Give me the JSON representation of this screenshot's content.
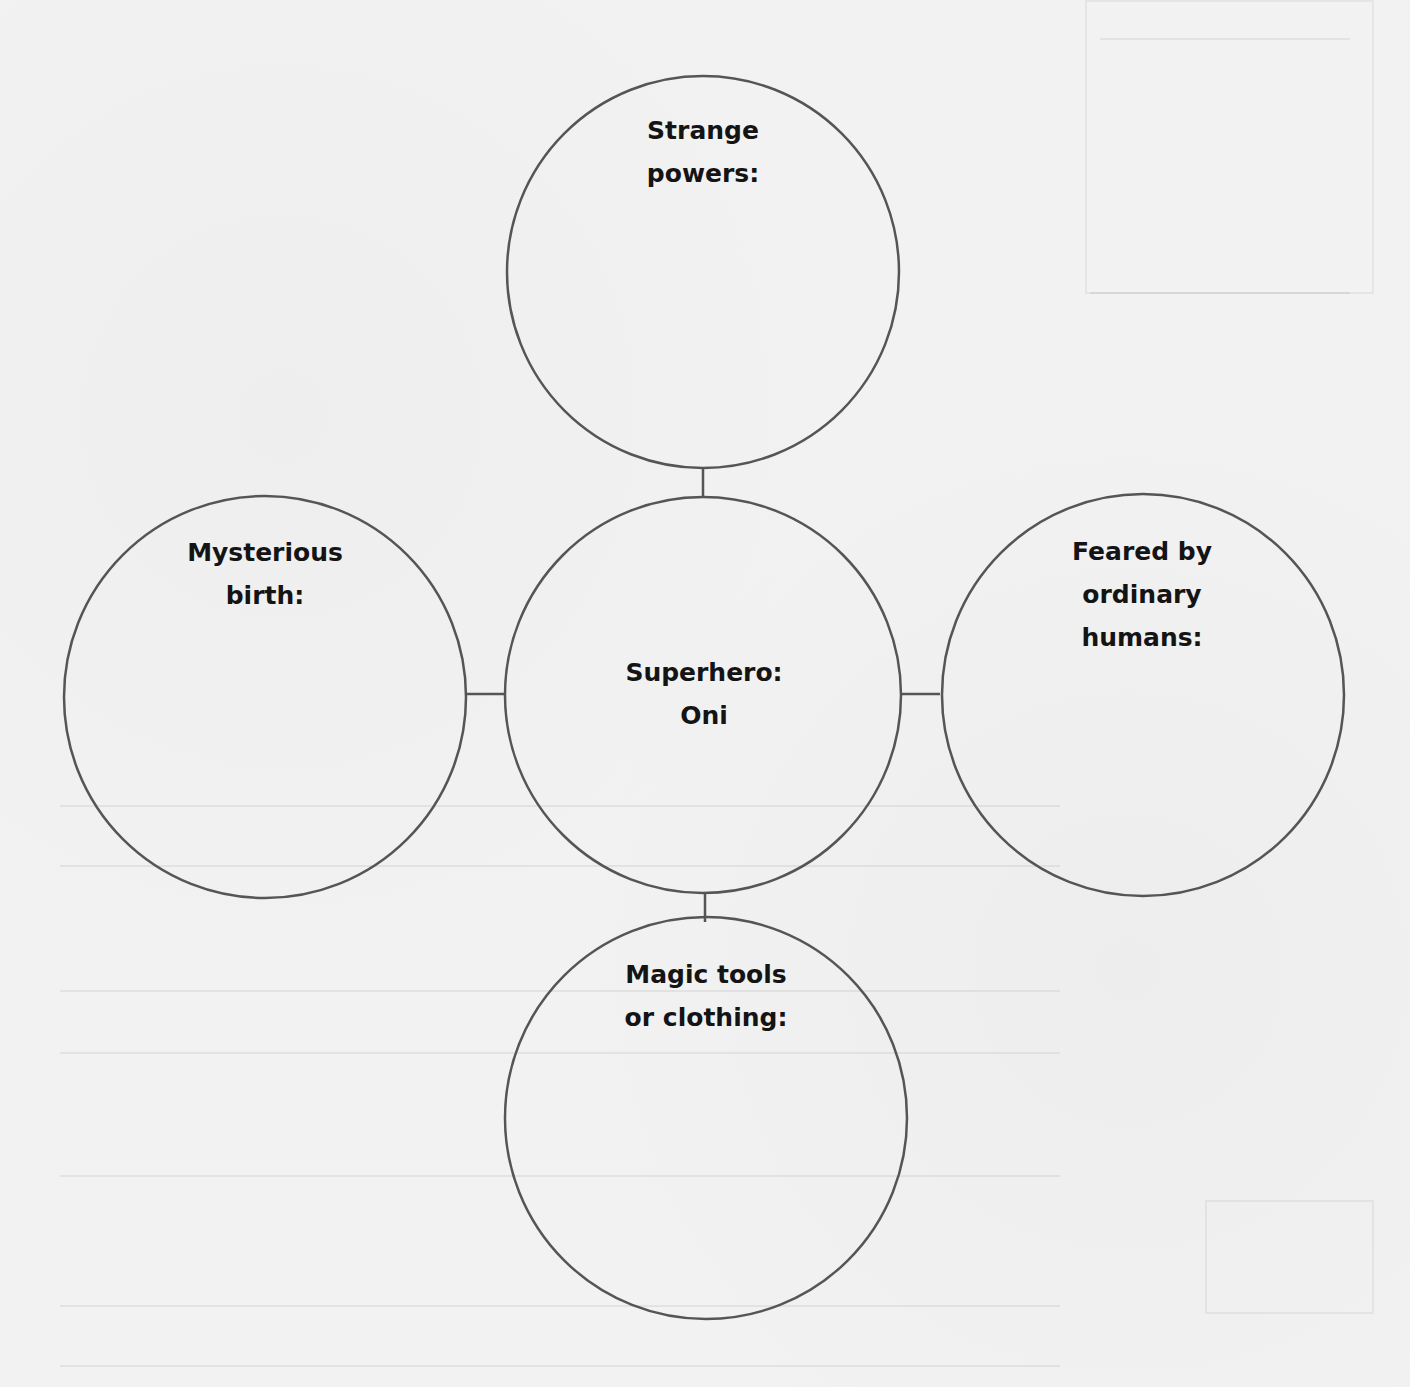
{
  "diagram": {
    "type": "web-organizer",
    "stroke_color": "#555555",
    "text_color": "#141414",
    "background_color": "#f2f2f2",
    "center": {
      "id": "superhero",
      "lines": [
        "Superhero:",
        "Oni"
      ]
    },
    "nodes": [
      {
        "id": "strange-powers",
        "position": "top",
        "lines": [
          "Strange",
          "powers:"
        ]
      },
      {
        "id": "mysterious-birth",
        "position": "left",
        "lines": [
          "Mysterious",
          "birth:"
        ]
      },
      {
        "id": "feared-by-humans",
        "position": "right",
        "lines": [
          "Feared by",
          "ordinary",
          "humans:"
        ]
      },
      {
        "id": "magic-tools",
        "position": "bottom",
        "lines": [
          "Magic tools",
          "or clothing:"
        ]
      }
    ],
    "edges": [
      {
        "from": "superhero",
        "to": "strange-powers"
      },
      {
        "from": "superhero",
        "to": "mysterious-birth"
      },
      {
        "from": "superhero",
        "to": "feared-by-humans"
      },
      {
        "from": "superhero",
        "to": "magic-tools"
      }
    ]
  }
}
